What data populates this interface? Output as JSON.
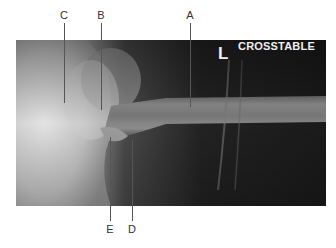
{
  "figure": {
    "overlay": {
      "side_marker": "L",
      "view_label": "CROSSTABLE"
    },
    "callouts_top": [
      {
        "label": "C",
        "x": 64
      },
      {
        "label": "B",
        "x": 101
      },
      {
        "label": "A",
        "x": 190
      }
    ],
    "callouts_bottom": [
      {
        "label": "E",
        "x": 110
      },
      {
        "label": "D",
        "x": 132
      }
    ],
    "colors": {
      "background": "#ffffff",
      "xray_dark": "#1a1a1a",
      "xray_bone": "#8a8a8a",
      "leader_line": "#555555",
      "label_text": "#333333"
    }
  }
}
